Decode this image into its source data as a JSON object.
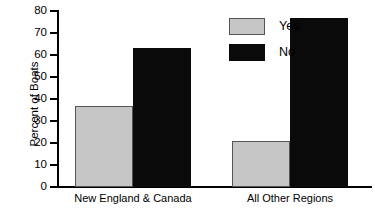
{
  "chart_data": {
    "type": "bar",
    "title": "",
    "xlabel": "",
    "ylabel": "Percent of Boats",
    "categories": [
      "New England & Canada",
      "All Other Regions"
    ],
    "series": [
      {
        "name": "Yes",
        "color": "#c6c6c6",
        "values": [
          37,
          21
        ]
      },
      {
        "name": "No",
        "color": "#0a0a0a",
        "values": [
          63,
          77
        ]
      }
    ],
    "ylim": [
      0,
      80
    ],
    "ytick_step": 10,
    "ytick_labels": [
      "80",
      "70",
      "60",
      "50",
      "40",
      "30",
      "20",
      "10",
      "0"
    ],
    "ytick_values": [
      80,
      70,
      60,
      50,
      40,
      30,
      20,
      10,
      0
    ],
    "grid": false,
    "legend_position": "upper-center",
    "legend_entries": [
      "Yes",
      "No"
    ]
  },
  "axis": {
    "y_title": "Percent of Boats"
  },
  "legend": {
    "items": [
      {
        "label": "Yes"
      },
      {
        "label": "No"
      }
    ]
  },
  "categories": [
    {
      "label": "New England & Canada"
    },
    {
      "label": "All Other Regions"
    }
  ]
}
